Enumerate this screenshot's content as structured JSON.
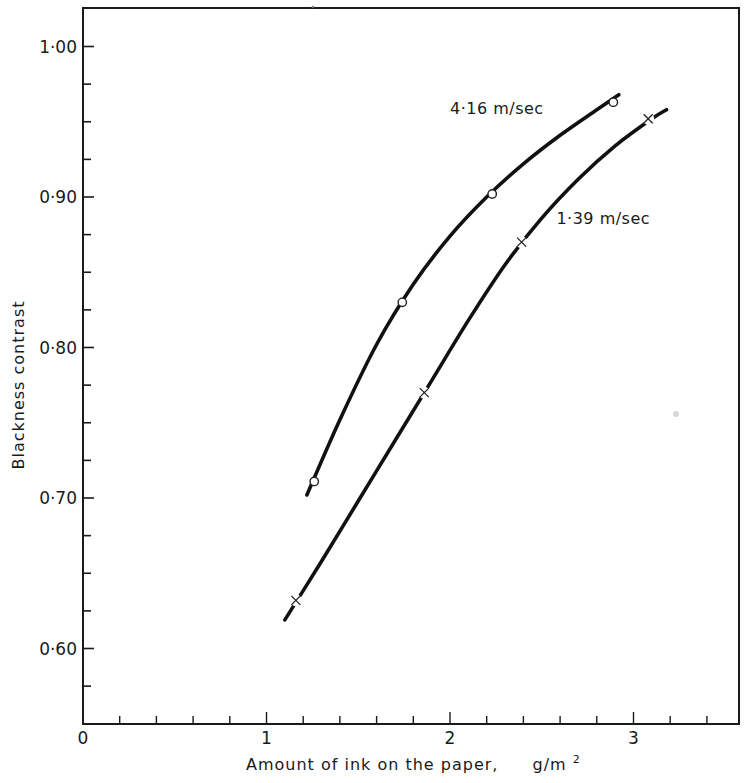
{
  "chart_data": {
    "type": "line",
    "title": "",
    "xlabel": "Amount of ink on the paper,",
    "xlabel_unit": "g/m",
    "xlabel_unit_sup": "2",
    "ylabel": "Blackness contrast",
    "xlim": [
      0,
      3.57
    ],
    "ylim": [
      0.55,
      1.03
    ],
    "grid": false,
    "legend_position": "inline labels near curves",
    "x_ticks_major": [
      0,
      1,
      2,
      3
    ],
    "x_tick_labels": [
      "0",
      "1",
      "2",
      "3"
    ],
    "x_ticks_minor_step": 0.2,
    "y_ticks_major": [
      0.6,
      0.7,
      0.8,
      0.9,
      1.0
    ],
    "y_tick_labels": [
      "0·60",
      "0·70",
      "0·80",
      "0·90",
      "1·00"
    ],
    "y_ticks_minor_step": 0.025,
    "series": [
      {
        "name": "4·16 m/sec",
        "marker": "circle",
        "points": [
          {
            "x": 1.26,
            "y": 0.711
          },
          {
            "x": 1.74,
            "y": 0.83
          },
          {
            "x": 2.23,
            "y": 0.902
          },
          {
            "x": 2.89,
            "y": 0.963
          }
        ],
        "curve": [
          {
            "x": 1.22,
            "y": 0.702
          },
          {
            "x": 1.4,
            "y": 0.752
          },
          {
            "x": 1.6,
            "y": 0.802
          },
          {
            "x": 1.8,
            "y": 0.842
          },
          {
            "x": 2.0,
            "y": 0.874
          },
          {
            "x": 2.2,
            "y": 0.9
          },
          {
            "x": 2.4,
            "y": 0.922
          },
          {
            "x": 2.6,
            "y": 0.941
          },
          {
            "x": 2.8,
            "y": 0.958
          },
          {
            "x": 2.92,
            "y": 0.968
          }
        ],
        "label_position": {
          "x": 2.0,
          "y": 0.955
        }
      },
      {
        "name": "1·39 m/sec",
        "marker": "cross",
        "points": [
          {
            "x": 1.16,
            "y": 0.632
          },
          {
            "x": 1.86,
            "y": 0.77
          },
          {
            "x": 2.39,
            "y": 0.87
          },
          {
            "x": 3.08,
            "y": 0.952
          }
        ],
        "curve": [
          {
            "x": 1.1,
            "y": 0.619
          },
          {
            "x": 1.3,
            "y": 0.658
          },
          {
            "x": 1.5,
            "y": 0.698
          },
          {
            "x": 1.7,
            "y": 0.738
          },
          {
            "x": 1.9,
            "y": 0.778
          },
          {
            "x": 2.1,
            "y": 0.818
          },
          {
            "x": 2.3,
            "y": 0.855
          },
          {
            "x": 2.5,
            "y": 0.886
          },
          {
            "x": 2.7,
            "y": 0.912
          },
          {
            "x": 2.9,
            "y": 0.934
          },
          {
            "x": 3.1,
            "y": 0.952
          },
          {
            "x": 3.18,
            "y": 0.958
          }
        ],
        "label_position": {
          "x": 2.58,
          "y": 0.882
        }
      }
    ]
  }
}
